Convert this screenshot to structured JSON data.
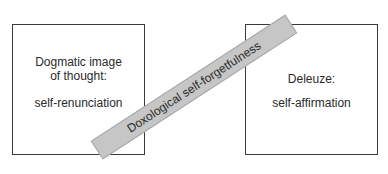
{
  "diagram": {
    "left_box": {
      "heading_lines": [
        "Dogmatic image",
        "of thought:"
      ],
      "value": "self-renunciation"
    },
    "right_box": {
      "heading": "Deleuze:",
      "value": "self-affirmation"
    },
    "band": {
      "label": "Doxological self-forgetfulness",
      "color": "#c6c6c6"
    }
  }
}
